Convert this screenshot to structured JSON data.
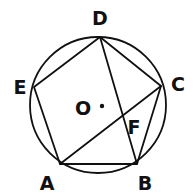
{
  "diagram": {
    "type": "geometry",
    "circle": {
      "center": "O",
      "cx": 98,
      "cy": 105,
      "r": 68
    },
    "points": {
      "A": {
        "x": 60,
        "y": 164,
        "label": "A",
        "lx": 47,
        "ly": 190
      },
      "B": {
        "x": 137,
        "y": 164,
        "label": "B",
        "lx": 145,
        "ly": 190
      },
      "C": {
        "x": 161,
        "y": 86,
        "label": "C",
        "lx": 178,
        "ly": 91
      },
      "D": {
        "x": 100,
        "y": 37,
        "label": "D",
        "lx": 100,
        "ly": 25
      },
      "E": {
        "x": 34,
        "y": 87,
        "label": "E",
        "lx": 20,
        "ly": 94
      },
      "F": {
        "x": 124,
        "y": 115,
        "label": "F",
        "lx": 134,
        "ly": 134
      },
      "O": {
        "x": 102,
        "y": 106,
        "label": "O",
        "lx": 83,
        "ly": 115
      }
    },
    "segments": [
      [
        "A",
        "B"
      ],
      [
        "B",
        "C"
      ],
      [
        "C",
        "D"
      ],
      [
        "D",
        "E"
      ],
      [
        "E",
        "A"
      ],
      [
        "A",
        "C"
      ],
      [
        "B",
        "D"
      ]
    ],
    "labels": {
      "A": "A",
      "B": "B",
      "C": "C",
      "D": "D",
      "E": "E",
      "F": "F",
      "O": "O"
    }
  }
}
